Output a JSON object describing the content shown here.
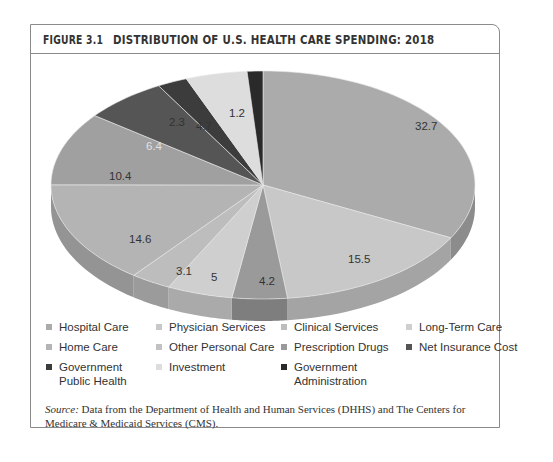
{
  "figure": {
    "number": "FIGURE 3.1",
    "title": "DISTRIBUTION OF U.S. HEALTH CARE SPENDING: 2018"
  },
  "chart_data": {
    "type": "pie",
    "title": "DISTRIBUTION OF U.S. HEALTH CARE SPENDING: 2018",
    "style": "3d-pie",
    "categories": [
      "Hospital Care",
      "Physician Services",
      "Clinical Services",
      "Long-Term Care",
      "Home Care",
      "Other Personal Care",
      "Prescription Drugs",
      "Net Insurance Cost",
      "Government Public Health",
      "Investment",
      "Government Administration"
    ],
    "values": [
      32.7,
      15.5,
      4.2,
      5,
      3.1,
      14.6,
      10.4,
      6.4,
      2.3,
      4.7,
      1.2
    ],
    "value_order_note": "clockwise from 12 o'clock as drawn",
    "slices": [
      {
        "label": "Hospital Care",
        "value": 32.7,
        "color": "#ababab"
      },
      {
        "label": "Physician Services",
        "value": 15.5,
        "color": "#c8c8c8"
      },
      {
        "label": "Prescription Drugs",
        "value": 4.2,
        "color": "#9a9a9a"
      },
      {
        "label": "Long-Term Care",
        "value": 5,
        "color": "#cfcfcf"
      },
      {
        "label": "Clinical Services",
        "value": 3.1,
        "color": "#bdbdbd"
      },
      {
        "label": "Home Care",
        "value": 14.6,
        "color": "#b4b4b4"
      },
      {
        "label": "Other Personal Care",
        "value": 10.4,
        "color": "#a0a0a0"
      },
      {
        "label": "Net Insurance Cost",
        "value": 6.4,
        "color": "#555555"
      },
      {
        "label": "Government Public Health",
        "value": 2.3,
        "color": "#3c3c3c"
      },
      {
        "label": "Investment",
        "value": 4.7,
        "color": "#dddddd"
      },
      {
        "label": "Government Administration",
        "value": 1.2,
        "color": "#2a2a2a"
      }
    ],
    "data_labels": [
      "32.7",
      "15.5",
      "4.2",
      "5",
      "3.1",
      "14.6",
      "10.4",
      "6.4",
      "2.3",
      "4.7",
      "1.2"
    ],
    "legend_position": "bottom"
  },
  "legend": [
    {
      "label": "Hospital Care",
      "color": "#ababab"
    },
    {
      "label": "Physician Services",
      "color": "#c8c8c8"
    },
    {
      "label": "Clinical Services",
      "color": "#bdbdbd"
    },
    {
      "label": "Long-Term Care",
      "color": "#cfcfcf"
    },
    {
      "label": "Home Care",
      "color": "#b4b4b4"
    },
    {
      "label": "Other Personal Care",
      "color": "#c2c2c2"
    },
    {
      "label": "Prescription Drugs",
      "color": "#9a9a9a"
    },
    {
      "label": "Net Insurance Cost",
      "color": "#555555"
    },
    {
      "label": "Government Public Health",
      "color": "#3c3c3c"
    },
    {
      "label": "Investment",
      "color": "#dddddd"
    },
    {
      "label": "Government Administration",
      "color": "#2a2a2a"
    }
  ],
  "source": {
    "prefix": "Source:",
    "text": " Data from the Department of Health and Human Services (DHHS) and The Centers for Medicare & Medicaid Services (CMS)."
  }
}
